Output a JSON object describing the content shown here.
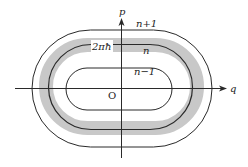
{
  "diagram": {
    "type": "phase-space",
    "axes": {
      "horizontal_label": "q",
      "vertical_label": "p",
      "origin_label": "O"
    },
    "orbits": [
      {
        "label": "n+1",
        "role": "outer"
      },
      {
        "label": "n",
        "role": "middle"
      },
      {
        "label": "n−1",
        "role": "inner"
      }
    ],
    "band": {
      "label": "2πħ",
      "color": "#c8c8c8"
    },
    "colors": {
      "line": "#2a2a2a",
      "band": "#c8c8c8",
      "background": "#ffffff"
    }
  }
}
